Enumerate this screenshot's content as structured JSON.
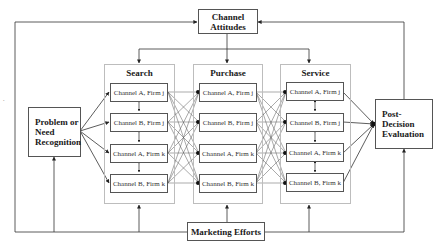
{
  "diagram": {
    "channel_attitudes": "Channel Attitudes",
    "problem": "Problem or Need Recognition",
    "post_decision": "Post-Decision Evaluation",
    "marketing": "Marketing Efforts",
    "stages": [
      {
        "title": "Search",
        "channels": [
          "Channel A, Firm j",
          "Channel B, Firm j",
          "Channel A, Firm k",
          "Channel B, Firm k"
        ]
      },
      {
        "title": "Purchase",
        "channels": [
          "Channel A, Firm j",
          "Channel B, Firm j",
          "Channel A, Firm k",
          "Channel B, Firm k"
        ]
      },
      {
        "title": "Service",
        "channels": [
          "Channel A, Firm j",
          "Channel B, Firm j",
          "Channel A, Firm k",
          "Channel B, Firm k"
        ]
      }
    ],
    "stray_mark": "."
  },
  "colors": {
    "line": "#333333",
    "group_border": "#bdbdbd",
    "box_border": "#555555"
  }
}
